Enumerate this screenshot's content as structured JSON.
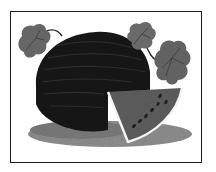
{
  "image": {
    "subject": "watermelon-with-slice-and-leaves",
    "style": "grayscale-clipart",
    "colors": {
      "frame": "#1a1a1a",
      "rind_dark": "#161616",
      "stripe": "#2e2e2e",
      "leaf": "#6a6a6a",
      "leaf_vein": "#3a3a3a",
      "flesh": "#5c5c5c",
      "rind_edge": "#f4f4f4",
      "seed": "#1e1e1e",
      "shadow": "#8a8a8a",
      "vine": "#2a2a2a"
    }
  }
}
